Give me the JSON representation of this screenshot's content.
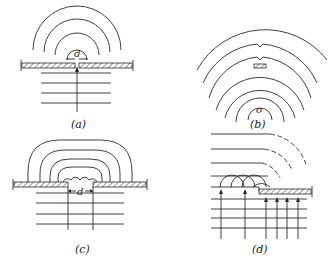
{
  "figure": {
    "panels": [
      {
        "id": "a",
        "label": "(a)",
        "dimension_label": "d",
        "content": "narrow slit in barrier; plane waves from below diffract into semicircular wavefronts"
      },
      {
        "id": "b",
        "label": "(b)",
        "center_label": "o",
        "content": "circular wavefronts from point o passing a small obstacle"
      },
      {
        "id": "c",
        "label": "(c)",
        "dimension_label": "d",
        "content": "wide aperture of width d; Huygens wavelets combine into flattened arcs"
      },
      {
        "id": "d",
        "label": "(d)",
        "content": "plane wave at edge of barrier; wavelets bend around edge with dashed curved continuation"
      }
    ]
  },
  "colors": {
    "line": "#2a2a2a",
    "background": "#ffffff"
  }
}
